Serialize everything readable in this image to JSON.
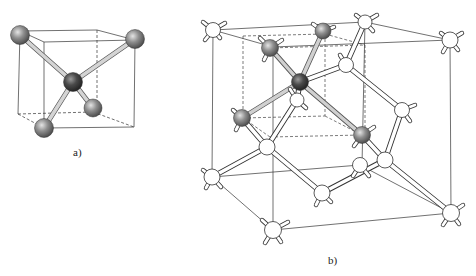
{
  "figure": {
    "panel_a": {
      "label": "a)",
      "description": "Tetrahedral coordination: central atom bonded to four atoms at alternating cube corners"
    },
    "panel_b": {
      "label": "b)",
      "description": "Diamond cubic crystal lattice unit cell with highlighted tetrahedral unit"
    }
  },
  "colors": {
    "line": "#333333",
    "bond_gray": "#c8c8c8",
    "atom_gray": "#7a7a7a",
    "atom_dark": "#3e3e3e",
    "atom_white": "#ffffff"
  }
}
